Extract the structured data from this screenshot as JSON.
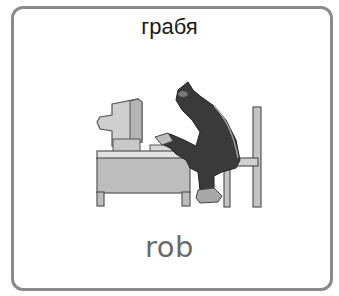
{
  "card": {
    "title": "грабя",
    "caption": "rob",
    "illustration": "burglar-at-computer-icon"
  },
  "colors": {
    "border": "#8a8a8a",
    "title_text": "#1a1a1a",
    "caption_text": "#6a6a6a",
    "figure": "#3a3a3a",
    "furniture": "#c4c4c4"
  }
}
